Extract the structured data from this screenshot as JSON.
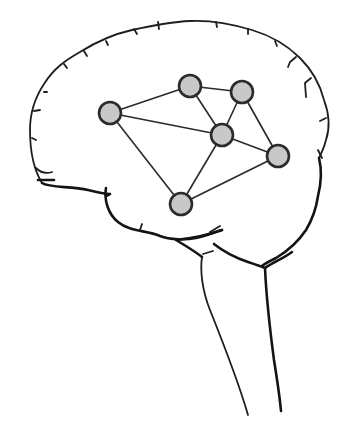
{
  "diagram": {
    "colors": {
      "background": "#ffffff",
      "outline": "#1e1e1e",
      "edge": "#2a2a2a",
      "node_fill": "#c8c8c8",
      "node_stroke": "#2b2b2b"
    },
    "node_radius": 11,
    "nodes": [
      {
        "id": "n1",
        "x": 110,
        "y": 113
      },
      {
        "id": "n2",
        "x": 190,
        "y": 86
      },
      {
        "id": "n3",
        "x": 242,
        "y": 92
      },
      {
        "id": "n4",
        "x": 222,
        "y": 135
      },
      {
        "id": "n5",
        "x": 278,
        "y": 156
      },
      {
        "id": "n6",
        "x": 181,
        "y": 204
      }
    ],
    "edges": [
      [
        "n1",
        "n2"
      ],
      [
        "n1",
        "n4"
      ],
      [
        "n1",
        "n6"
      ],
      [
        "n2",
        "n3"
      ],
      [
        "n2",
        "n4"
      ],
      [
        "n3",
        "n4"
      ],
      [
        "n3",
        "n5"
      ],
      [
        "n4",
        "n5"
      ],
      [
        "n4",
        "n6"
      ],
      [
        "n6",
        "n5"
      ]
    ]
  }
}
